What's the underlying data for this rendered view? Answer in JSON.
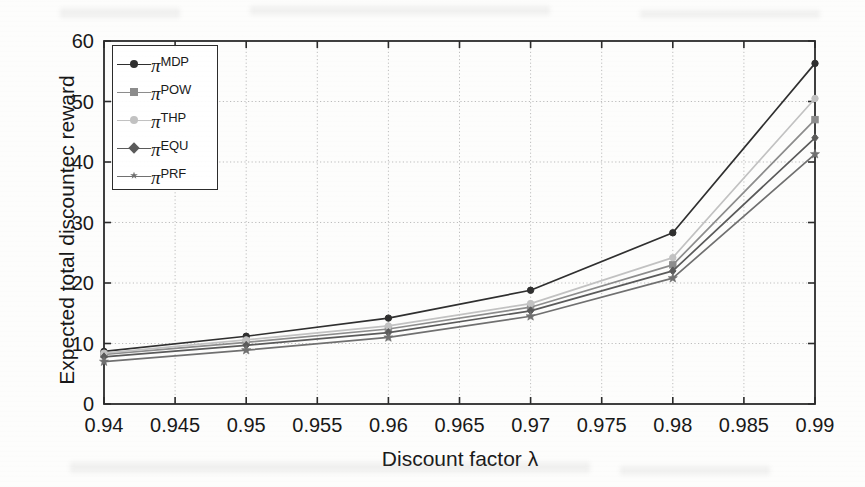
{
  "chart_data": {
    "type": "line",
    "title": "",
    "xlabel": "Discount factor λ",
    "ylabel": "Expected total discountec reward",
    "x": [
      0.94,
      0.95,
      0.96,
      0.97,
      0.98,
      0.99
    ],
    "xlim": [
      0.94,
      0.99
    ],
    "ylim": [
      0,
      60
    ],
    "xticks": [
      "0.94",
      "0.945",
      "0.95",
      "0.955",
      "0.96",
      "0.965",
      "0.97",
      "0.975",
      "0.98",
      "0.985",
      "0.99"
    ],
    "xtick_values": [
      0.94,
      0.945,
      0.95,
      0.955,
      0.96,
      0.965,
      0.97,
      0.975,
      0.98,
      0.985,
      0.99
    ],
    "yticks": [
      "0",
      "10",
      "20",
      "30",
      "40",
      "50",
      "60"
    ],
    "ytick_values": [
      0,
      10,
      20,
      30,
      40,
      50,
      60
    ],
    "grid": true,
    "grid_style": "dotted",
    "grid_color": "#bdbdbd",
    "legend_position": "upper left",
    "series": [
      {
        "name": "πMDP",
        "label_base": "π",
        "label_sup": "MDP",
        "color": "#2f2f2f",
        "marker": "circle",
        "values": [
          8.7,
          11.2,
          14.2,
          18.8,
          28.3,
          56.3
        ]
      },
      {
        "name": "πPOW",
        "label_base": "π",
        "label_sup": "POW",
        "color": "#8c8c8c",
        "marker": "square",
        "values": [
          8.2,
          10.2,
          12.4,
          16.0,
          23.0,
          47.0
        ]
      },
      {
        "name": "πTHP",
        "label_base": "π",
        "label_sup": "THP",
        "color": "#c2c2c2",
        "marker": "circle",
        "values": [
          8.4,
          10.6,
          12.9,
          16.6,
          24.2,
          50.5
        ]
      },
      {
        "name": "πEQU",
        "label_base": "π",
        "label_sup": "EQU",
        "color": "#5a5a5a",
        "marker": "diamond",
        "values": [
          7.8,
          9.7,
          11.8,
          15.4,
          22.0,
          44.0
        ]
      },
      {
        "name": "πPRF",
        "label_base": "π",
        "label_sup": "PRF",
        "color": "#707070",
        "marker": "star",
        "values": [
          7.0,
          8.9,
          11.0,
          14.5,
          20.8,
          41.3
        ]
      }
    ]
  },
  "axes": {
    "frame_color": "#2b2b2b",
    "background": "#fdfdfc"
  }
}
